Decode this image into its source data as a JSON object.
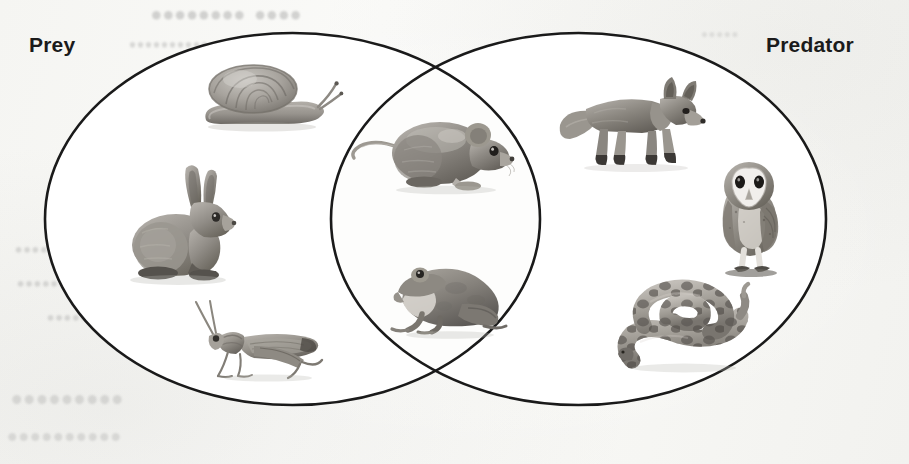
{
  "diagram": {
    "type": "venn",
    "background_color": "#f7f7f5",
    "stroke_color": "#1a1a1a",
    "stroke_width": 2.5,
    "circle_fill": "#ffffff",
    "label_color": "#1b1b1b",
    "sets": [
      {
        "id": "prey",
        "label": "Prey",
        "position": "top-left"
      },
      {
        "id": "predator",
        "label": "Predator",
        "position": "top-right"
      }
    ],
    "regions": [
      {
        "id": "prey-only",
        "set": "prey",
        "members": [
          "snail",
          "rabbit",
          "grasshopper"
        ]
      },
      {
        "id": "intersection",
        "set": "both",
        "members": [
          "mouse",
          "frog"
        ]
      },
      {
        "id": "predator-only",
        "set": "predator",
        "members": [
          "fox",
          "owl",
          "snake"
        ]
      }
    ]
  },
  "animals": {
    "snail": {
      "name": "snail",
      "icon": "snail-icon",
      "label": "Snail",
      "region": "prey-only",
      "facing": "right"
    },
    "rabbit": {
      "name": "rabbit",
      "icon": "rabbit-icon",
      "label": "Rabbit",
      "region": "prey-only",
      "facing": "right"
    },
    "grasshopper": {
      "name": "grasshopper",
      "icon": "grasshopper-icon",
      "label": "Grasshopper",
      "region": "prey-only",
      "facing": "left"
    },
    "mouse": {
      "name": "mouse",
      "icon": "mouse-icon",
      "label": "Mouse",
      "region": "intersection",
      "facing": "right"
    },
    "frog": {
      "name": "frog",
      "icon": "frog-icon",
      "label": "Frog",
      "region": "intersection",
      "facing": "left"
    },
    "fox": {
      "name": "fox",
      "icon": "fox-icon",
      "label": "Fox",
      "region": "predator-only",
      "facing": "right"
    },
    "owl": {
      "name": "owl",
      "icon": "owl-icon",
      "label": "Barn owl",
      "region": "predator-only",
      "facing": "front"
    },
    "snake": {
      "name": "snake",
      "icon": "snake-icon",
      "label": "Snake",
      "region": "predator-only",
      "facing": "coiled"
    }
  },
  "artifacts": {
    "bleed_through_note": "faint mirrored text showing through from the reverse side of the page",
    "lines": [
      "•••• ••••••••",
      "••••••••••",
      "••••••••",
      "•••••••••",
      "•••••••••••",
      "•••••••••",
      "••••••••••",
      "•••••"
    ]
  }
}
